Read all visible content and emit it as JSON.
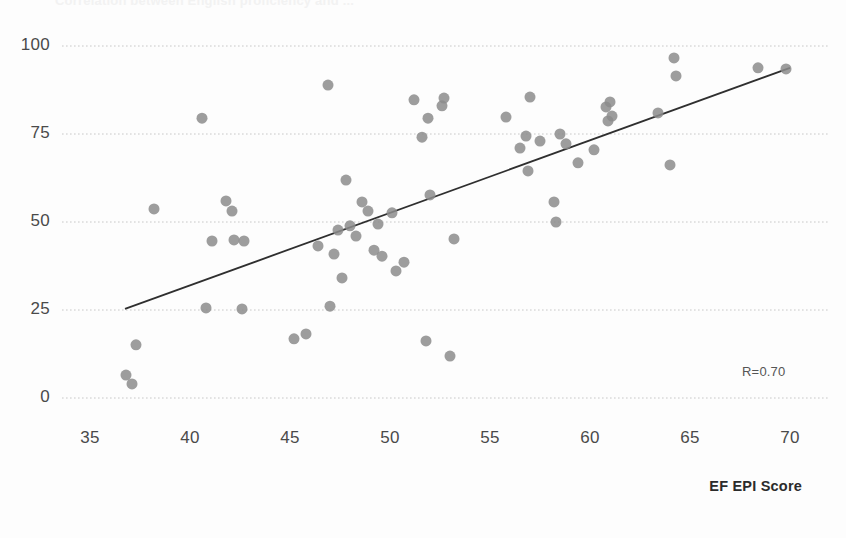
{
  "figure": {
    "title_faint": "Correlation between English proficiency and ...",
    "background_color": "#fdfdfd",
    "point_color": "#8c8c8c",
    "trendline_color": "#2f2f2f",
    "gridline_color": "#c8c8c8"
  },
  "annotations": {
    "r_label": "R=0.70"
  },
  "axes": {
    "x_title": "EF EPI Score",
    "y_title": "",
    "x_ticks": [
      "35",
      "40",
      "45",
      "50",
      "55",
      "60",
      "65",
      "70"
    ],
    "y_ticks": [
      "0",
      "25",
      "50",
      "75",
      "100"
    ]
  },
  "chart_data": {
    "type": "scatter",
    "title": "",
    "subtitle": "",
    "xlabel": "EF EPI Score",
    "ylabel": "",
    "xlim": [
      34.0,
      71.0
    ],
    "ylim": [
      -3,
      103
    ],
    "xticks": [
      35,
      40,
      45,
      50,
      55,
      60,
      65,
      70
    ],
    "yticks": [
      0,
      25,
      50,
      75,
      100
    ],
    "grid": "horizontal-dotted",
    "legend": "none",
    "marker": {
      "shape": "circle",
      "size_px": 11,
      "color": "#8c8c8c",
      "opacity": 0.85
    },
    "annotation": {
      "text": "R=0.70",
      "x": 67.6,
      "y": 8
    },
    "correlation_R": 0.7,
    "trendline": {
      "type": "linear",
      "x_start": 36.75,
      "y_start": 25.3,
      "x_end": 70.0,
      "y_end": 93.8
    },
    "points": [
      {
        "x": 36.8,
        "y": 6.5
      },
      {
        "x": 37.1,
        "y": 4.0
      },
      {
        "x": 37.3,
        "y": 15.1
      },
      {
        "x": 38.2,
        "y": 53.7
      },
      {
        "x": 40.6,
        "y": 79.5
      },
      {
        "x": 40.8,
        "y": 25.6
      },
      {
        "x": 41.1,
        "y": 44.6
      },
      {
        "x": 41.8,
        "y": 56.0
      },
      {
        "x": 42.1,
        "y": 53.1
      },
      {
        "x": 42.2,
        "y": 44.9
      },
      {
        "x": 42.6,
        "y": 25.3
      },
      {
        "x": 42.7,
        "y": 44.6
      },
      {
        "x": 45.2,
        "y": 16.8
      },
      {
        "x": 45.8,
        "y": 18.2
      },
      {
        "x": 46.4,
        "y": 43.2
      },
      {
        "x": 46.9,
        "y": 88.9
      },
      {
        "x": 47.0,
        "y": 26.1
      },
      {
        "x": 47.2,
        "y": 40.9
      },
      {
        "x": 47.4,
        "y": 47.7
      },
      {
        "x": 47.6,
        "y": 34.1
      },
      {
        "x": 47.8,
        "y": 61.9
      },
      {
        "x": 48.0,
        "y": 48.9
      },
      {
        "x": 48.3,
        "y": 46.0
      },
      {
        "x": 48.6,
        "y": 55.7
      },
      {
        "x": 48.9,
        "y": 53.1
      },
      {
        "x": 49.2,
        "y": 42.0
      },
      {
        "x": 49.4,
        "y": 49.4
      },
      {
        "x": 49.6,
        "y": 40.3
      },
      {
        "x": 50.1,
        "y": 52.6
      },
      {
        "x": 50.3,
        "y": 36.1
      },
      {
        "x": 50.7,
        "y": 38.6
      },
      {
        "x": 51.2,
        "y": 84.7
      },
      {
        "x": 51.6,
        "y": 74.1
      },
      {
        "x": 51.8,
        "y": 16.2
      },
      {
        "x": 51.9,
        "y": 79.5
      },
      {
        "x": 52.0,
        "y": 57.7
      },
      {
        "x": 52.6,
        "y": 83.0
      },
      {
        "x": 52.7,
        "y": 85.2
      },
      {
        "x": 53.0,
        "y": 11.9
      },
      {
        "x": 53.2,
        "y": 45.2
      },
      {
        "x": 55.8,
        "y": 79.8
      },
      {
        "x": 56.5,
        "y": 71.0
      },
      {
        "x": 56.8,
        "y": 74.4
      },
      {
        "x": 56.9,
        "y": 64.5
      },
      {
        "x": 57.0,
        "y": 85.5
      },
      {
        "x": 57.5,
        "y": 73.0
      },
      {
        "x": 58.2,
        "y": 55.7
      },
      {
        "x": 58.3,
        "y": 50.0
      },
      {
        "x": 58.5,
        "y": 75.0
      },
      {
        "x": 58.8,
        "y": 72.2
      },
      {
        "x": 59.4,
        "y": 66.8
      },
      {
        "x": 60.2,
        "y": 70.5
      },
      {
        "x": 60.8,
        "y": 82.7
      },
      {
        "x": 60.9,
        "y": 78.7
      },
      {
        "x": 61.0,
        "y": 84.1
      },
      {
        "x": 61.1,
        "y": 80.1
      },
      {
        "x": 63.4,
        "y": 81.0
      },
      {
        "x": 64.0,
        "y": 66.2
      },
      {
        "x": 64.2,
        "y": 96.6
      },
      {
        "x": 64.3,
        "y": 91.5
      },
      {
        "x": 68.4,
        "y": 93.8
      },
      {
        "x": 69.8,
        "y": 93.5
      }
    ]
  },
  "plot_geometry": {
    "x_origin_px": 90,
    "px_per_x_unit": 20,
    "y_zero_px": 398,
    "px_per_y_unit": 3.52,
    "grid_x_left": 62,
    "grid_x_right": 830
  }
}
